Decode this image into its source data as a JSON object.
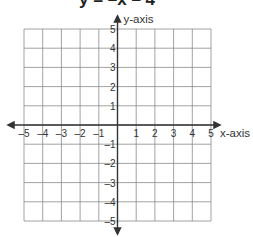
{
  "chart_data": {
    "type": "line",
    "title": "y = –x – 4",
    "xlabel": "x-axis",
    "ylabel": "y-axis",
    "xlim": [
      -5,
      5
    ],
    "ylim": [
      -5,
      5
    ],
    "grid": true,
    "x_ticks": [
      -5,
      -4,
      -3,
      -2,
      -1,
      1,
      2,
      3,
      4,
      5
    ],
    "y_ticks": [
      5,
      4,
      3,
      2,
      1,
      -1,
      -2,
      -3,
      -4,
      -5
    ],
    "x_tick_labels": [
      "–5",
      "–4",
      "–3",
      "–2",
      "–1",
      "1",
      "2",
      "3",
      "4",
      "5"
    ],
    "y_tick_labels": [
      "5",
      "4",
      "3",
      "2",
      "1",
      "–1",
      "–2",
      "–3",
      "–4",
      "–5"
    ],
    "series": []
  }
}
